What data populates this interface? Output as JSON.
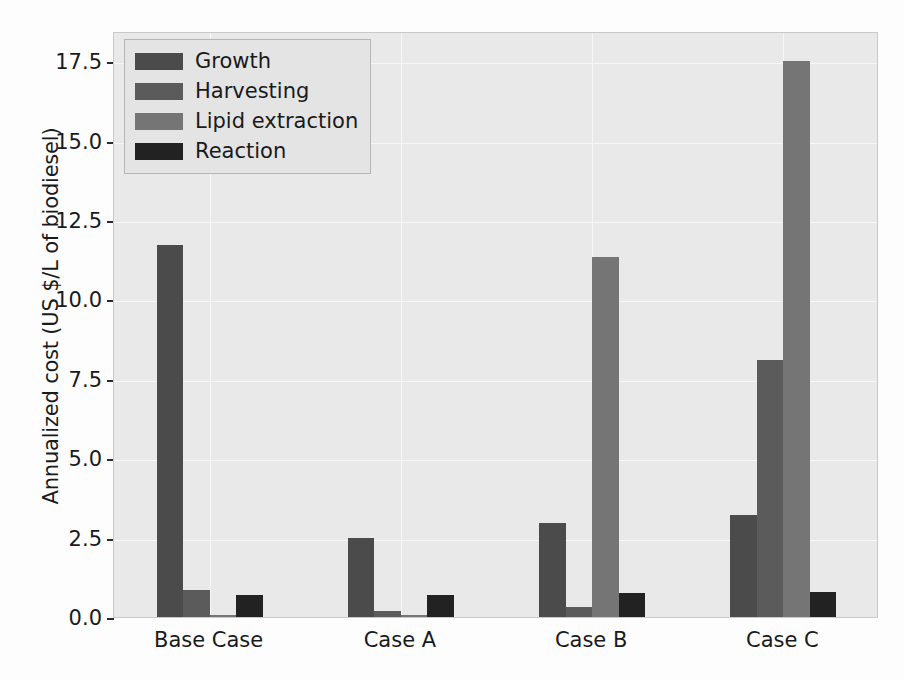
{
  "chart_data": {
    "type": "bar",
    "title": "",
    "xlabel": "",
    "ylabel": "Annualized cost (US $/L of biodiesel)",
    "categories": [
      "Base Case",
      "Case A",
      "Case B",
      "Case C"
    ],
    "series": [
      {
        "name": "Growth",
        "color": "#4b4b4b",
        "values": [
          11.7,
          2.5,
          2.95,
          3.2
        ]
      },
      {
        "name": "Harvesting",
        "color": "#5b5b5b",
        "values": [
          0.85,
          0.18,
          0.3,
          8.1
        ]
      },
      {
        "name": "Lipid extraction",
        "color": "#757575",
        "values": [
          0.05,
          0.05,
          11.35,
          17.5
        ]
      },
      {
        "name": "Reaction",
        "color": "#222222",
        "values": [
          0.7,
          0.7,
          0.75,
          0.8
        ]
      }
    ],
    "ylim": [
      0.0,
      18.45
    ],
    "yticks": [
      0.0,
      2.5,
      5.0,
      7.5,
      10.0,
      12.5,
      15.0,
      17.5
    ],
    "ytick_labels": [
      "0.0",
      "2.5",
      "5.0",
      "7.5",
      "10.0",
      "12.5",
      "15.0",
      "17.5"
    ],
    "grid": true,
    "legend_position": "upper left",
    "plot_background": "#e9e9e9",
    "grid_color": "#f7f7f7"
  }
}
